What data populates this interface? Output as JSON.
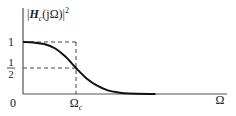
{
  "chart_data": {
    "type": "line",
    "title": "",
    "ylabel_parts": {
      "pre": "|",
      "H": "H",
      "sub": "c",
      "arg": "(jΩ)",
      "post": "|",
      "sup": "2"
    },
    "ylabel": "|H_c(jΩ)|²",
    "xlabel": "Ω",
    "x_ticks": [
      {
        "value": 0,
        "label": "0"
      },
      {
        "value": 1,
        "label": "Ω",
        "sub": "c"
      }
    ],
    "y_ticks": [
      {
        "value": 1,
        "label": "1"
      },
      {
        "value": 0.5,
        "label_num": "1",
        "label_den": "2"
      }
    ],
    "xlim": [
      0,
      2.85
    ],
    "ylim": [
      0,
      1.5
    ],
    "grid": false,
    "reference_lines": [
      {
        "type": "horizontal",
        "y": 1,
        "x_to": 1,
        "style": "dashed"
      },
      {
        "type": "horizontal",
        "y": 0.5,
        "x_to": 1,
        "style": "dashed"
      },
      {
        "type": "vertical",
        "x": 1,
        "y_to": 1,
        "style": "dashed"
      }
    ],
    "series": [
      {
        "name": "|H_c(jΩ)|^2 (Butterworth magnitude-squared)",
        "x": [
          0,
          0.2,
          0.4,
          0.6,
          0.8,
          1.0,
          1.2,
          1.4,
          1.6,
          1.8,
          2.0,
          2.5
        ],
        "y": [
          1.0,
          0.99,
          0.96,
          0.88,
          0.72,
          0.5,
          0.3,
          0.16,
          0.07,
          0.03,
          0.01,
          0.0
        ]
      }
    ]
  }
}
